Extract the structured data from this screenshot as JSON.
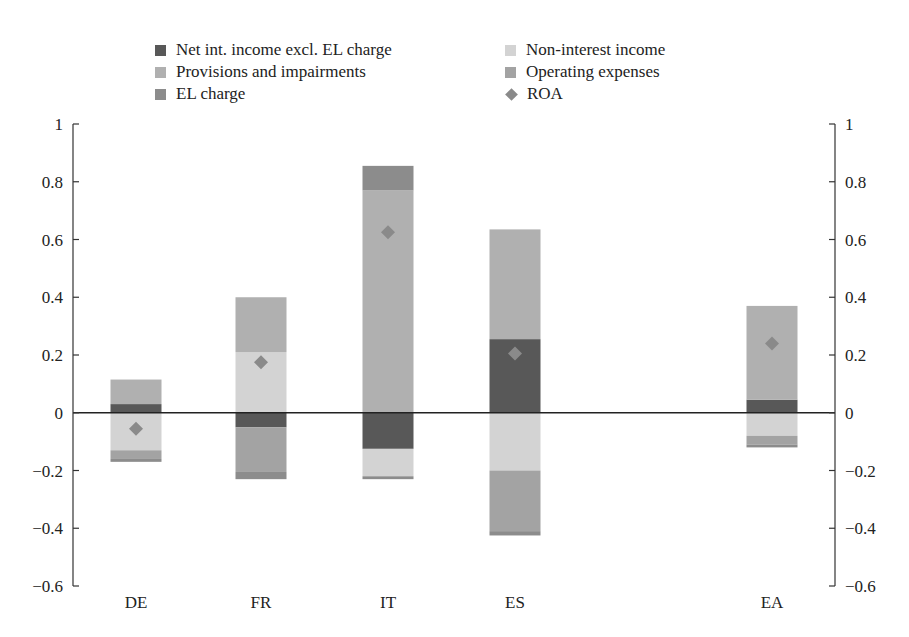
{
  "chart_data": {
    "type": "bar",
    "stacked": true,
    "title": "",
    "xlabel": "",
    "ylabel": "",
    "ylim": [
      -0.6,
      1
    ],
    "yticks": [
      -0.6,
      -0.4,
      -0.2,
      0,
      0.2,
      0.4,
      0.6,
      0.8,
      1
    ],
    "ytick_labels": [
      "−0.6",
      "−0.4",
      "−0.2",
      "0",
      "0.2",
      "0.4",
      "0.6",
      "0.8",
      "1"
    ],
    "secondary_y": {
      "ylim": [
        -0.6,
        1
      ],
      "ticks_mirrored": true
    },
    "grid": false,
    "legend_position": "top",
    "categories": [
      "DE",
      "FR",
      "IT",
      "ES",
      "",
      "EA"
    ],
    "series": [
      {
        "name": "Net int. income excl. EL charge",
        "color": "#585858",
        "values": [
          0.03,
          -0.05,
          -0.125,
          0.255,
          null,
          0.045
        ]
      },
      {
        "name": "Non-interest income",
        "color": "#d3d3d3",
        "values": [
          -0.13,
          0.21,
          -0.095,
          -0.2,
          null,
          -0.08
        ]
      },
      {
        "name": "Provisions and impairments",
        "color": "#b0b0b0",
        "values": [
          0.085,
          0.19,
          0.77,
          0.38,
          null,
          0.325
        ]
      },
      {
        "name": "Operating expenses",
        "color": "#a3a3a3",
        "values": [
          -0.03,
          -0.155,
          0,
          -0.21,
          null,
          -0.03
        ]
      },
      {
        "name": "EL charge",
        "color": "#8c8c8c",
        "values": [
          -0.01,
          -0.025,
          -0.01,
          -0.015,
          null,
          -0.01
        ]
      },
      {
        "name": "EL charge (positive)",
        "color": "#8c8c8c",
        "values": [
          0,
          0,
          0.085,
          0,
          null,
          0
        ]
      }
    ],
    "roa": {
      "name": "ROA",
      "color": "#8a8a8a",
      "marker": "diamond",
      "values": [
        -0.055,
        0.175,
        0.625,
        0.205,
        null,
        0.24
      ]
    }
  },
  "legend": {
    "items": [
      {
        "label": "Net int. income excl. EL charge",
        "color": "#585858",
        "marker": "square"
      },
      {
        "label": "Non-interest income",
        "color": "#d3d3d3",
        "marker": "square"
      },
      {
        "label": "Provisions and impairments",
        "color": "#b0b0b0",
        "marker": "square"
      },
      {
        "label": "Operating expenses",
        "color": "#a3a3a3",
        "marker": "square"
      },
      {
        "label": "EL charge",
        "color": "#8c8c8c",
        "marker": "square"
      },
      {
        "label": "ROA",
        "color": "#8a8a8a",
        "marker": "diamond"
      }
    ]
  },
  "stacks": [
    {
      "category": "DE",
      "segments": [
        {
          "series": "Net int. income excl. EL charge",
          "from": 0,
          "to": 0.03,
          "color": "#585858"
        },
        {
          "series": "Provisions and impairments",
          "from": 0.03,
          "to": 0.115,
          "color": "#b0b0b0"
        },
        {
          "series": "Non-interest income",
          "from": 0,
          "to": -0.13,
          "color": "#d3d3d3"
        },
        {
          "series": "Operating expenses",
          "from": -0.13,
          "to": -0.16,
          "color": "#a3a3a3"
        },
        {
          "series": "EL charge",
          "from": -0.16,
          "to": -0.17,
          "color": "#8c8c8c"
        }
      ]
    },
    {
      "category": "FR",
      "segments": [
        {
          "series": "Non-interest income",
          "from": 0,
          "to": 0.21,
          "color": "#d3d3d3"
        },
        {
          "series": "Provisions and impairments",
          "from": 0.21,
          "to": 0.4,
          "color": "#b0b0b0"
        },
        {
          "series": "Net int. income excl. EL charge",
          "from": 0,
          "to": -0.05,
          "color": "#585858"
        },
        {
          "series": "Operating expenses",
          "from": -0.05,
          "to": -0.205,
          "color": "#a3a3a3"
        },
        {
          "series": "EL charge",
          "from": -0.205,
          "to": -0.23,
          "color": "#8c8c8c"
        }
      ]
    },
    {
      "category": "IT",
      "segments": [
        {
          "series": "Provisions and impairments",
          "from": 0,
          "to": 0.77,
          "color": "#b0b0b0"
        },
        {
          "series": "EL charge",
          "from": 0.77,
          "to": 0.855,
          "color": "#8c8c8c"
        },
        {
          "series": "Net int. income excl. EL charge",
          "from": 0,
          "to": -0.125,
          "color": "#585858"
        },
        {
          "series": "Non-interest income",
          "from": -0.125,
          "to": -0.22,
          "color": "#d3d3d3"
        },
        {
          "series": "EL charge",
          "from": -0.22,
          "to": -0.23,
          "color": "#8c8c8c"
        }
      ]
    },
    {
      "category": "ES",
      "segments": [
        {
          "series": "Net int. income excl. EL charge",
          "from": 0,
          "to": 0.255,
          "color": "#585858"
        },
        {
          "series": "Provisions and impairments",
          "from": 0.255,
          "to": 0.635,
          "color": "#b0b0b0"
        },
        {
          "series": "Non-interest income",
          "from": 0,
          "to": -0.2,
          "color": "#d3d3d3"
        },
        {
          "series": "Operating expenses",
          "from": -0.2,
          "to": -0.41,
          "color": "#a3a3a3"
        },
        {
          "series": "EL charge",
          "from": -0.41,
          "to": -0.425,
          "color": "#8c8c8c"
        }
      ]
    },
    {
      "category": "EA",
      "segments": [
        {
          "series": "Net int. income excl. EL charge",
          "from": 0,
          "to": 0.045,
          "color": "#585858"
        },
        {
          "series": "Provisions and impairments",
          "from": 0.045,
          "to": 0.37,
          "color": "#b0b0b0"
        },
        {
          "series": "Non-interest income",
          "from": 0,
          "to": -0.08,
          "color": "#d3d3d3"
        },
        {
          "series": "Operating expenses",
          "from": -0.08,
          "to": -0.11,
          "color": "#a3a3a3"
        },
        {
          "series": "EL charge",
          "from": -0.11,
          "to": -0.12,
          "color": "#8c8c8c"
        }
      ]
    }
  ],
  "layout": {
    "plot_left": 73,
    "plot_right": 835,
    "y_top_value": 1,
    "y_top_px": 124,
    "y_bottom_value": -0.6,
    "y_bottom_px": 586,
    "bar_width": 51,
    "bar_centers": {
      "DE": 136,
      "FR": 261,
      "IT": 388,
      "ES": 515,
      "EA": 772
    },
    "label_y": 608
  }
}
